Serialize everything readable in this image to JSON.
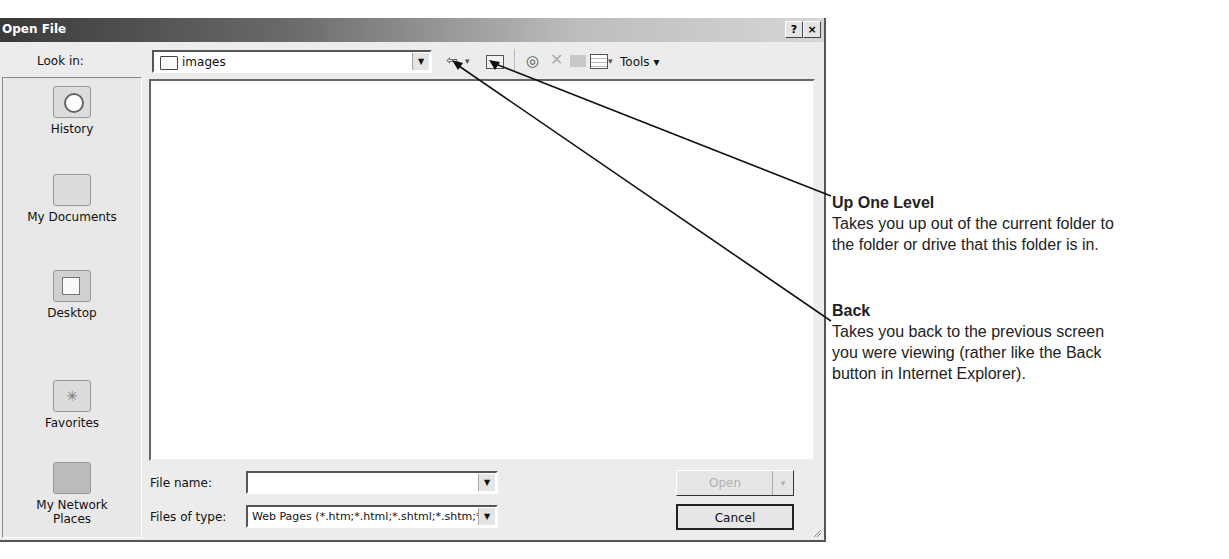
{
  "dialog": {
    "title": "Open File",
    "title_buttons": {
      "help": "?",
      "close": "×"
    },
    "look_in": {
      "label": "Look in:",
      "value": "images"
    },
    "toolbar": {
      "back": "back-icon",
      "back_dropdown": "▾",
      "up_one_level": "up-folder-icon",
      "search_web": "search-web-icon",
      "delete": "delete-icon",
      "new_folder": "new-folder-icon",
      "views": "views-icon",
      "views_dropdown": "▾",
      "tools_label": "Tools ▾"
    },
    "places": [
      {
        "label": "History",
        "icon": "history-icon"
      },
      {
        "label": "My Documents",
        "icon": "my-documents-icon"
      },
      {
        "label": "Desktop",
        "icon": "desktop-icon"
      },
      {
        "label": "Favorites",
        "icon": "favorites-icon"
      },
      {
        "label": "My Network Places",
        "icon": "network-places-icon"
      }
    ],
    "file_name": {
      "label": "File name:",
      "value": ""
    },
    "files_of_type": {
      "label": "Files of type:",
      "value": "Web Pages (*.htm;*.html;*.shtml;*.shtm;*.stm;*.asp;*.a"
    },
    "buttons": {
      "open": "Open",
      "open_dropdown": "▾",
      "cancel": "Cancel"
    }
  },
  "annotations": [
    {
      "heading": "Up One Level",
      "line1": "Takes you up out of the current folder to",
      "line2": "the folder or drive that this folder is in."
    },
    {
      "heading": "Back",
      "line1": "Takes you back to the previous screen",
      "line2": "you were viewing (rather like the Back",
      "line3": "button in Internet Explorer)."
    }
  ]
}
